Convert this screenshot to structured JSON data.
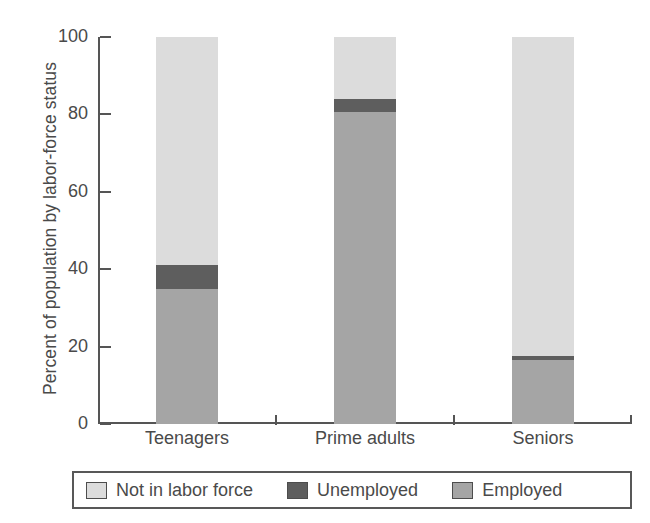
{
  "chart_data": {
    "type": "bar",
    "subtype": "stacked-bar-100",
    "title": "",
    "xlabel": "",
    "ylabel": "Percent of population by labor-force status",
    "ylim": [
      0,
      100
    ],
    "yticks": [
      0,
      20,
      40,
      60,
      80,
      100
    ],
    "ytick_labels": [
      "0",
      "20",
      "40",
      "60",
      "80",
      "100"
    ],
    "grid": false,
    "legend_position": "bottom",
    "categories": [
      "Teenagers",
      "Prime adults",
      "Seniors"
    ],
    "series": [
      {
        "name": "Employed",
        "color": "#a5a5a5",
        "values": [
          35,
          80.5,
          16.5
        ]
      },
      {
        "name": "Unemployed",
        "color": "#5e5e5e",
        "values": [
          6,
          3.5,
          1
        ]
      },
      {
        "name": "Not in labor force",
        "color": "#dcdcdc",
        "values": [
          59,
          16,
          82.5
        ]
      }
    ],
    "stack_order_bottom_to_top": [
      "Employed",
      "Unemployed",
      "Not in labor force"
    ]
  },
  "axis": {
    "y_title": "Percent of population by labor-force status",
    "y_tick_labels": [
      "100",
      "80",
      "60",
      "40",
      "20",
      "0"
    ],
    "x_tick_labels": [
      "Teenagers",
      "Prime adults",
      "Seniors"
    ]
  },
  "legend": {
    "items": [
      {
        "label": "Not in labor force",
        "color": "#dcdcdc"
      },
      {
        "label": "Unemployed",
        "color": "#5e5e5e"
      },
      {
        "label": "Employed",
        "color": "#a5a5a5"
      }
    ]
  },
  "colors": {
    "not_in_labor_force": "#dcdcdc",
    "unemployed": "#5e5e5e",
    "employed": "#a5a5a5",
    "axis": "#555555",
    "text": "#4a4a4a",
    "background": "#ffffff"
  }
}
